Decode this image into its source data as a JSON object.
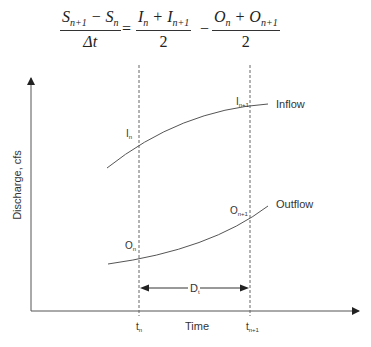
{
  "equation": {
    "lhs": {
      "numerator": [
        "S",
        "n+1",
        " − S",
        "n"
      ],
      "denominator": "Δt"
    },
    "equals": "=",
    "term1": {
      "numerator": [
        "I",
        "n",
        " + I",
        "n+1"
      ],
      "denominator": "2"
    },
    "minus": "−",
    "term2": {
      "numerator": [
        "O",
        "n",
        " + O",
        "n+1"
      ],
      "denominator": "2"
    }
  },
  "diagram": {
    "y_axis_label": "Discharge, cfs",
    "x_axis_label": "Time",
    "curves": {
      "inflow": {
        "label": "Inflow",
        "point_n": "I",
        "point_n_sub": "n",
        "point_n1": "I",
        "point_n1_sub": "n+1"
      },
      "outflow": {
        "label": "Outflow",
        "point_n": "O",
        "point_n_sub": "n",
        "point_n1": "O",
        "point_n1_sub": "n+1"
      }
    },
    "interval": {
      "label": "D",
      "label_sub": "t"
    },
    "ticks": {
      "t_n": "t",
      "t_n_sub": "n",
      "t_n1": "t",
      "t_n1_sub": "n+1"
    }
  }
}
